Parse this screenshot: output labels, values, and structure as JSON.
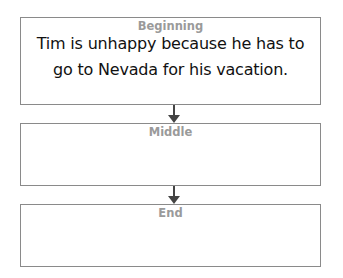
{
  "diagram": {
    "type": "story-sequence-flowchart",
    "boxes": [
      {
        "title": "Beginning",
        "text": "Tim is unhappy because he has to go to Nevada for his vacation."
      },
      {
        "title": "Middle",
        "text": ""
      },
      {
        "title": "End",
        "text": ""
      }
    ],
    "arrows": [
      {
        "from": "Beginning",
        "to": "Middle",
        "icon": "arrow-down-icon"
      },
      {
        "from": "Middle",
        "to": "End",
        "icon": "arrow-down-icon"
      }
    ],
    "colors": {
      "border": "#8a8a8a",
      "title": "#9a9a9a",
      "text": "#111111",
      "arrow": "#444444"
    }
  }
}
